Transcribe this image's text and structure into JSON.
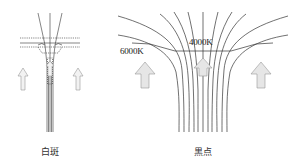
{
  "diagrams": [
    {
      "id": "faculae",
      "caption": "白斑"
    },
    {
      "id": "sunspot",
      "caption": "黒点",
      "temperature_labels": {
        "outside": "6000K",
        "inside": "4000K"
      }
    }
  ],
  "colors": {
    "line": "#333333",
    "arrow_fill": "#e6e6e6",
    "arrow_stroke": "#999999"
  }
}
